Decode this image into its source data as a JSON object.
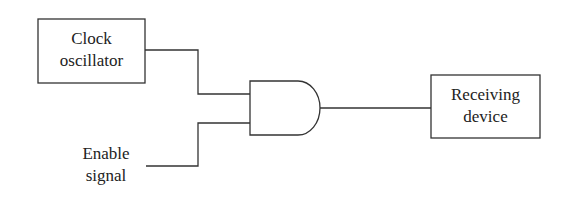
{
  "diagram": {
    "clock_box": {
      "line1": "Clock",
      "line2": "oscillator"
    },
    "enable": {
      "line1": "Enable",
      "line2": "signal"
    },
    "gate": {
      "type": "AND"
    },
    "receiver_box": {
      "line1": "Receiving",
      "line2": "device"
    },
    "stroke_color": "#333333"
  }
}
